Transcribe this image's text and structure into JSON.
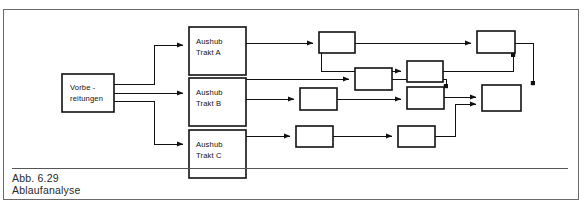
{
  "figure": {
    "caption_number": "Abb. 6.29",
    "caption_title": "Ablaufanalyse",
    "frame_color": "#6a6a6a",
    "line_color": "#1a1a1a",
    "box_fill": "#ffffff"
  },
  "diagram": {
    "type": "flow-network",
    "start_node": {
      "id": "vorbereitungen",
      "line1": "Vorbe -",
      "line2": "reitungen",
      "x": 62,
      "y": 74,
      "w": 52,
      "h": 38
    },
    "trakt_nodes": [
      {
        "id": "aushub-trakt-a",
        "line1": "Aushub",
        "line2": "Trakt  A",
        "x": 189,
        "y": 27,
        "w": 57,
        "h": 48
      },
      {
        "id": "aushub-trakt-b",
        "line1": "Aushub",
        "line2": "Trakt  B",
        "x": 189,
        "y": 78,
        "w": 57,
        "h": 48
      },
      {
        "id": "aushub-trakt-c",
        "line1": "Aushub",
        "line2": "Trakt  C",
        "x": 189,
        "y": 130,
        "w": 57,
        "h": 48
      }
    ],
    "blank_nodes": [
      {
        "id": "node-a1",
        "x": 319,
        "y": 32,
        "w": 36,
        "h": 21
      },
      {
        "id": "node-a2",
        "x": 407,
        "y": 61,
        "w": 36,
        "h": 21
      },
      {
        "id": "node-a3",
        "x": 477,
        "y": 31,
        "w": 38,
        "h": 22
      },
      {
        "id": "node-b1",
        "x": 355,
        "y": 68,
        "w": 37,
        "h": 22
      },
      {
        "id": "node-b2",
        "x": 300,
        "y": 88,
        "w": 37,
        "h": 22
      },
      {
        "id": "node-b3",
        "x": 407,
        "y": 87,
        "w": 37,
        "h": 22
      },
      {
        "id": "node-c1",
        "x": 296,
        "y": 126,
        "w": 37,
        "h": 21
      },
      {
        "id": "node-c2",
        "x": 398,
        "y": 126,
        "w": 37,
        "h": 21
      },
      {
        "id": "node-end",
        "x": 482,
        "y": 85,
        "w": 39,
        "h": 26
      }
    ],
    "edge_count": 18
  }
}
